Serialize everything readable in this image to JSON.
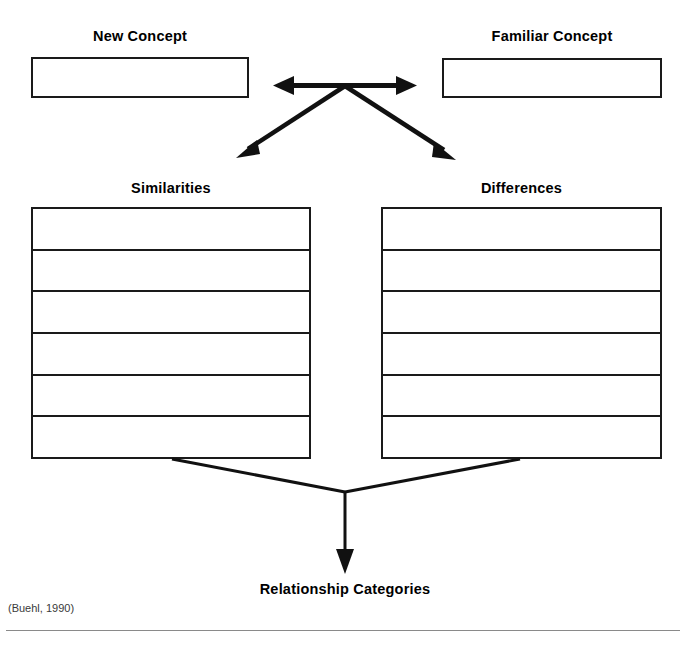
{
  "diagram": {
    "type": "concept-comparison-organizer",
    "top_boxes": [
      {
        "label": "New Concept",
        "value": "",
        "side": "left"
      },
      {
        "label": "Familiar Concept",
        "value": "",
        "side": "right"
      }
    ],
    "columns": [
      {
        "label": "Similarities",
        "side": "left",
        "rows": [
          "",
          "",
          "",
          "",
          "",
          ""
        ]
      },
      {
        "label": "Differences",
        "side": "right",
        "rows": [
          "",
          "",
          "",
          "",
          "",
          ""
        ]
      }
    ],
    "outcome": {
      "label": "Relationship Categories"
    },
    "connectors": [
      {
        "name": "compare-double-arrow",
        "kind": "double-headed-horizontal",
        "from": "New Concept",
        "to": "Familiar Concept"
      },
      {
        "name": "branch-to-similarities",
        "kind": "diagonal-arrow",
        "from": "compare-hub",
        "to": "Similarities"
      },
      {
        "name": "branch-to-differences",
        "kind": "diagonal-arrow",
        "from": "compare-hub",
        "to": "Differences"
      },
      {
        "name": "merge-to-relationship-categories",
        "kind": "converging-arrow",
        "from": [
          "Similarities",
          "Differences"
        ],
        "to": "Relationship Categories"
      }
    ],
    "colors": {
      "stroke": "#1a1a1a",
      "text": "#000000",
      "background": "#ffffff",
      "rule": "#8a8a8a",
      "attribution_text": "#3a3a3a"
    }
  },
  "attribution": "(Buehl, 1990)"
}
